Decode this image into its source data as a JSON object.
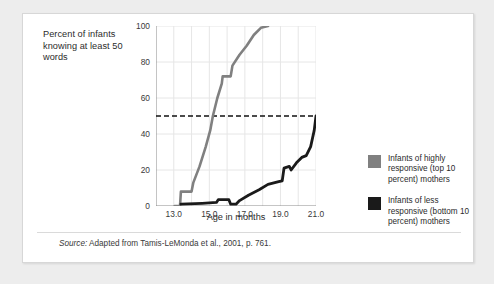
{
  "figure": {
    "y_axis_title": "Percent of infants knowing at least 50 words",
    "x_axis_title": "Age in months",
    "source": {
      "lead": "Source:",
      "text": " Adapted from Tamis-LeMonda et al., 2001, p. 761."
    }
  },
  "legend": {
    "position": "right",
    "items": [
      {
        "label": "Infants of highly responsive (top 10 percent) mothers",
        "color": "#808080",
        "swatch_name": "legend-swatch-highly-responsive"
      },
      {
        "label": "Infants of less responsive (bottom 10 percent) mothers",
        "color": "#1a1a1a",
        "swatch_name": "legend-swatch-less-responsive"
      }
    ]
  },
  "chart_data": {
    "type": "line",
    "title": "",
    "xlabel": "Age in months",
    "ylabel": "Percent of infants knowing at least 50 words",
    "xlim": [
      12.0,
      21.0
    ],
    "ylim": [
      0,
      100
    ],
    "xticks": [
      "13.0",
      "15.0",
      "17.0",
      "19.0",
      "21.0"
    ],
    "xtick_values": [
      13.0,
      15.0,
      17.0,
      19.0,
      21.0
    ],
    "yticks": [
      "0",
      "20",
      "40",
      "60",
      "80",
      "100"
    ],
    "ytick_values": [
      0,
      20,
      40,
      60,
      80,
      100
    ],
    "grid": true,
    "grid_x_step": 1.0,
    "grid_y_step": 20,
    "reference_line": {
      "y": 50,
      "style": "dashed",
      "color": "#111111"
    },
    "series": [
      {
        "name": "Infants of highly responsive (top 10 percent) mothers",
        "color": "#808080",
        "points": [
          [
            13.05,
            0
          ],
          [
            13.35,
            0
          ],
          [
            13.4,
            8
          ],
          [
            14.0,
            8
          ],
          [
            14.1,
            13
          ],
          [
            14.45,
            22
          ],
          [
            14.8,
            33
          ],
          [
            15.05,
            42
          ],
          [
            15.2,
            50
          ],
          [
            15.45,
            60
          ],
          [
            15.7,
            68
          ],
          [
            15.75,
            72
          ],
          [
            16.2,
            72
          ],
          [
            16.3,
            78
          ],
          [
            16.7,
            84
          ],
          [
            17.1,
            89
          ],
          [
            17.5,
            95
          ],
          [
            17.9,
            99
          ],
          [
            18.3,
            100
          ]
        ]
      },
      {
        "name": "Infants of less responsive (bottom 10 percent) mothers",
        "color": "#1a1a1a",
        "points": [
          [
            13.4,
            1
          ],
          [
            14.6,
            1.5
          ],
          [
            15.4,
            2
          ],
          [
            15.5,
            3.5
          ],
          [
            16.1,
            3.5
          ],
          [
            16.2,
            1
          ],
          [
            16.5,
            1
          ],
          [
            16.7,
            3
          ],
          [
            17.2,
            6
          ],
          [
            17.8,
            9
          ],
          [
            18.3,
            12
          ],
          [
            18.9,
            13.5
          ],
          [
            19.1,
            14
          ],
          [
            19.2,
            21
          ],
          [
            19.5,
            22
          ],
          [
            19.6,
            20
          ],
          [
            19.9,
            24
          ],
          [
            20.2,
            27
          ],
          [
            20.45,
            28
          ],
          [
            20.7,
            33
          ],
          [
            20.9,
            42
          ],
          [
            21.0,
            50
          ]
        ]
      }
    ]
  }
}
